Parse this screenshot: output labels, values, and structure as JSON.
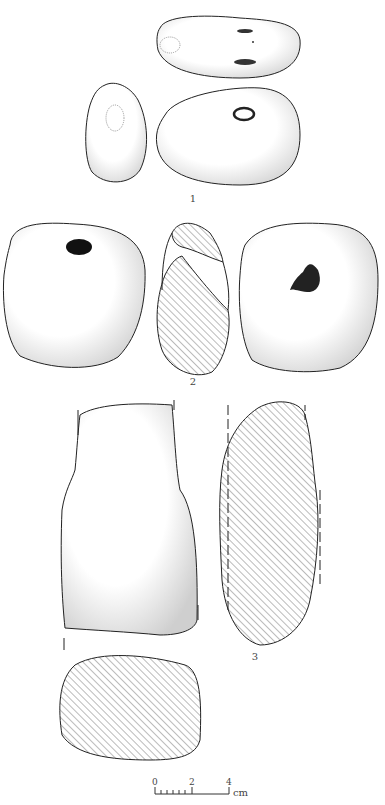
{
  "figure": {
    "type": "archaeological artifact illustration",
    "artifacts": [
      {
        "label": "1",
        "views": [
          "top view",
          "side view",
          "front view with perforation"
        ]
      },
      {
        "label": "2",
        "views": [
          "front view with perforation",
          "cross-section",
          "back view with depression"
        ]
      },
      {
        "label": "3",
        "views": [
          "face view",
          "longitudinal section",
          "transverse section"
        ]
      }
    ],
    "scale_bar": {
      "ticks": [
        "0",
        "2",
        "4"
      ],
      "unit": "cm"
    },
    "colors": {
      "line": "#222222",
      "stipple": "#777777",
      "hatch": "#555555",
      "background": "#ffffff"
    }
  }
}
